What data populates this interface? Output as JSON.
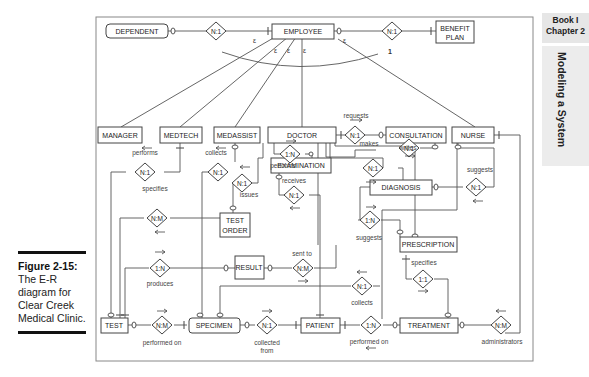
{
  "side_tab": {
    "book": "Book I",
    "chapter": "Chapter 2",
    "section": "Modeling a System"
  },
  "caption": {
    "title": "Figure 2-15:",
    "body": "The E-R diagram for Clear Creek Medical Clinic."
  },
  "entities": {
    "dependent": "DEPENDENT",
    "employee": "EMPLOYEE",
    "benefit_plan_1": "BENEFIT",
    "benefit_plan_2": "PLAN",
    "manager": "MANAGER",
    "medtech": "MEDTECH",
    "medassist": "MEDASSIST",
    "doctor": "DOCTOR",
    "consultation": "CONSULTATION",
    "nurse": "NURSE",
    "examination": "EXAMINATION",
    "test_order_1": "TEST",
    "test_order_2": "ORDER",
    "diagnosis": "DIAGNOSIS",
    "prescription": "PRESCRIPTION",
    "result": "RESULT",
    "test": "TEST",
    "specimen": "SPECIMEN",
    "patient": "PATIENT",
    "treatment": "TREATMENT"
  },
  "relationships": {
    "dependent_employee": "N:1",
    "employee_benefit": "N:1",
    "doctor_consultation": "N:1",
    "medtech_test": "N:1",
    "medassist_specimen": "N:1",
    "doctor_examination": "1:N",
    "doctor_testorder": "N:1",
    "examination_patient": "N:1",
    "doctor_diagnosis": "N:1",
    "nurse_consultation": "N:1",
    "nurse_diagnosis": "N:1",
    "testorder_test": "N:M",
    "diagnosis_prescription": "1:N",
    "test_result": "1:N",
    "result_doctor": "N:M",
    "specimen_nurse": "N:1",
    "prescription_treatment": "1:1",
    "test_specimen": "N:M",
    "specimen_patient": "N:1",
    "patient_treatment": "1:N",
    "treatment_nurse": "N:M"
  },
  "verbs": {
    "requests": "requests",
    "performs_medtech": "performs",
    "collects_medassist": "collects",
    "performs_doctor": "performs",
    "issues": "issues",
    "receives": "receives",
    "makes": "makes",
    "writes": "writes",
    "suggests_nurse": "suggests",
    "specifies_order": "specifies",
    "suggests_diag": "suggests",
    "produces": "produces",
    "sent_to": "sent to",
    "collects_nurse": "collects",
    "specifies_rx": "specifies",
    "performed_on_test": "performed on",
    "collected_from_1": "collected",
    "collected_from_2": "from",
    "performed_on_patient": "performed on",
    "administrators": "administrators"
  },
  "generalization": {
    "marker": "ε",
    "constraint": "1"
  }
}
